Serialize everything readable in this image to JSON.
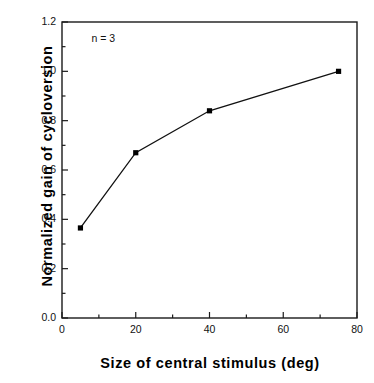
{
  "chart_data": {
    "type": "line",
    "title": "",
    "xlabel": "Size of central stimulus (deg)",
    "ylabel": "Normalized gain of cycloversion",
    "xlim": [
      0,
      80
    ],
    "ylim": [
      0.0,
      1.2
    ],
    "grid": false,
    "legend": null,
    "annotations": [
      {
        "text": "n = 3",
        "x": 5,
        "y": 1.13
      }
    ],
    "xticks": [
      0,
      20,
      40,
      60,
      80
    ],
    "xtick_labels": [
      "0",
      "20",
      "40",
      "60",
      "80"
    ],
    "xminor_ticks": [
      10,
      30,
      50,
      70
    ],
    "yticks": [
      0.0,
      0.2,
      0.4,
      0.6,
      0.8,
      1.0,
      1.2
    ],
    "ytick_labels": [
      "0.0",
      "0.2",
      "0.4",
      "0.6",
      "0.8",
      "1.0",
      "1.2"
    ],
    "yminor_ticks": [
      0.1,
      0.3,
      0.5,
      0.7,
      0.9,
      1.1
    ],
    "marker": "square",
    "line_color": "#000000",
    "marker_color": "#000000",
    "x": [
      5,
      20,
      40,
      75
    ],
    "values": [
      0.365,
      0.67,
      0.84,
      1.0
    ],
    "series": [
      {
        "name": "Normalized gain of cycloversion",
        "x": [
          5,
          20,
          40,
          75
        ],
        "values": [
          0.365,
          0.67,
          0.84,
          1.0
        ]
      }
    ]
  }
}
